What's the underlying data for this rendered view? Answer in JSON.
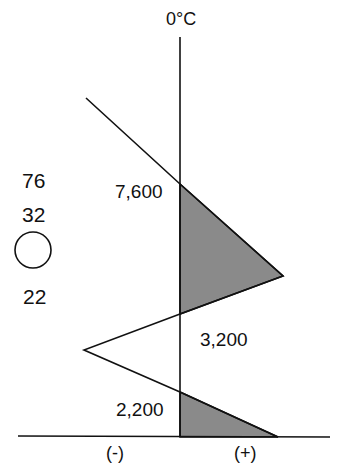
{
  "title": "0°C",
  "axis": {
    "negative_label": "(-)",
    "positive_label": "(+)"
  },
  "levels": {
    "upper": "7,600",
    "middle": "3,200",
    "lower": "2,200"
  },
  "station_model": {
    "temperature": "76",
    "dewpoint": "32",
    "sky_cover_symbol": "empty-circle",
    "bottom_value": "22"
  },
  "colors": {
    "line": "#111111",
    "positive_area_fill": "#8a8a8a",
    "background": "#ffffff"
  }
}
